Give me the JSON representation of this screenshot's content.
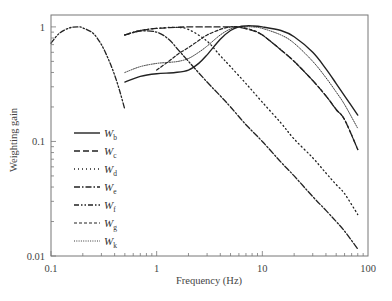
{
  "chart_data": {
    "type": "line",
    "title": "",
    "xlabel": "Frequency (Hz)",
    "ylabel": "Weighting gain",
    "xscale": "log",
    "yscale": "log",
    "xlim": [
      0.1,
      100
    ],
    "ylim": [
      0.01,
      1.27
    ],
    "grid": false,
    "legend_position": "lower-left (inside)",
    "x_ticks": [
      {
        "value": 0.1,
        "label": "0.1"
      },
      {
        "value": 1,
        "label": "1"
      },
      {
        "value": 10,
        "label": "10"
      },
      {
        "value": 100,
        "label": "100"
      }
    ],
    "y_ticks": [
      {
        "value": 0.01,
        "label": "0.01"
      },
      {
        "value": 0.1,
        "label": "0.1"
      },
      {
        "value": 1,
        "label": "1"
      }
    ],
    "series": [
      {
        "name": "Wb",
        "base": "W",
        "sub": "b",
        "style": "solid",
        "x": [
          0.5,
          0.7,
          1,
          1.5,
          2,
          2.5,
          3,
          4,
          5,
          6,
          7,
          8,
          10,
          15,
          20,
          30,
          40,
          50,
          60,
          80
        ],
        "y": [
          0.33,
          0.37,
          0.39,
          0.4,
          0.42,
          0.48,
          0.57,
          0.78,
          0.93,
          1.0,
          1.02,
          1.02,
          1.0,
          0.93,
          0.82,
          0.6,
          0.43,
          0.32,
          0.25,
          0.17
        ]
      },
      {
        "name": "Wc",
        "base": "W",
        "sub": "c",
        "style": "long-dash",
        "x": [
          0.5,
          0.7,
          1,
          1.5,
          2,
          3,
          4,
          5,
          6,
          8,
          10,
          15,
          20,
          30,
          40,
          50,
          60,
          80
        ],
        "y": [
          0.85,
          0.93,
          0.97,
          0.99,
          1.0,
          1.0,
          1.0,
          1.0,
          0.99,
          0.93,
          0.85,
          0.63,
          0.5,
          0.34,
          0.25,
          0.19,
          0.155,
          0.085
        ]
      },
      {
        "name": "Wd",
        "base": "W",
        "sub": "d",
        "style": "dotted",
        "x": [
          0.5,
          0.7,
          1,
          1.5,
          2,
          3,
          4,
          5,
          7,
          10,
          15,
          20,
          30,
          40,
          50,
          60,
          80
        ],
        "y": [
          0.85,
          0.93,
          0.97,
          0.99,
          0.95,
          0.75,
          0.56,
          0.45,
          0.32,
          0.22,
          0.145,
          0.105,
          0.072,
          0.053,
          0.042,
          0.035,
          0.023
        ]
      },
      {
        "name": "We",
        "base": "W",
        "sub": "e",
        "style": "dash-dot",
        "x": [
          0.5,
          0.7,
          1,
          1.3,
          1.6,
          2,
          3,
          4,
          5,
          7,
          10,
          15,
          20,
          30,
          40,
          50,
          60,
          80
        ],
        "y": [
          0.85,
          0.92,
          0.9,
          0.78,
          0.63,
          0.5,
          0.33,
          0.25,
          0.2,
          0.14,
          0.1,
          0.066,
          0.05,
          0.033,
          0.025,
          0.02,
          0.0165,
          0.0115
        ]
      },
      {
        "name": "Wf",
        "base": "W",
        "sub": "f",
        "style": "dash-dot-dot",
        "x": [
          0.1,
          0.12,
          0.15,
          0.18,
          0.2,
          0.25,
          0.3,
          0.35,
          0.4,
          0.45,
          0.5
        ],
        "y": [
          0.72,
          0.88,
          0.98,
          1.0,
          0.98,
          0.88,
          0.7,
          0.52,
          0.38,
          0.27,
          0.19
        ]
      },
      {
        "name": "Wg",
        "base": "W",
        "sub": "g",
        "style": "short-dash",
        "x": [
          1,
          1.3,
          1.6,
          2,
          2.5,
          3,
          4,
          5,
          6,
          8,
          10,
          15,
          20,
          30,
          40,
          50,
          60,
          80
        ],
        "y": [
          0.42,
          0.5,
          0.58,
          0.66,
          0.76,
          0.85,
          0.95,
          1.0,
          1.0,
          0.94,
          0.85,
          0.63,
          0.5,
          0.34,
          0.25,
          0.19,
          0.155,
          0.085
        ]
      },
      {
        "name": "Wk",
        "base": "W",
        "sub": "k",
        "style": "fine-dot",
        "x": [
          0.5,
          0.7,
          1,
          1.3,
          1.6,
          2,
          2.5,
          3,
          4,
          5,
          6,
          8,
          10,
          15,
          20,
          30,
          40,
          50,
          60,
          80
        ],
        "y": [
          0.4,
          0.45,
          0.48,
          0.49,
          0.5,
          0.53,
          0.6,
          0.68,
          0.85,
          0.96,
          1.0,
          1.0,
          0.97,
          0.85,
          0.72,
          0.5,
          0.36,
          0.27,
          0.21,
          0.13
        ]
      }
    ]
  },
  "plot_area": {
    "left": 51,
    "right": 368,
    "top": 15,
    "bottom": 256
  },
  "colors": {
    "line": "#222222",
    "frame": "#777777",
    "text": "#444444",
    "background": "#ffffff"
  }
}
